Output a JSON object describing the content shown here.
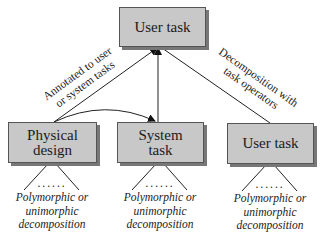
{
  "diagram": {
    "nodes": {
      "top_user_task": {
        "label": "User task"
      },
      "physical_design": {
        "label_line1": "Physical",
        "label_line2": "design"
      },
      "system_task": {
        "label_line1": "System",
        "label_line2": "task"
      },
      "right_user_task": {
        "label": "User task"
      }
    },
    "edges": {
      "annotated": {
        "line1": "Annotated to user",
        "line2": "or system tasks"
      },
      "decomposition": {
        "line1": "Decomposition with",
        "line2": "task operators"
      }
    },
    "captions": {
      "physical_design": {
        "line1": "Polymorphic or",
        "line2": "unimorphic",
        "line3": "decomposition"
      },
      "system_task": {
        "line1": "Polymorphic or",
        "line2": "unimorphic",
        "line3": "decomposition"
      },
      "right_user_task": {
        "line1": "Polymorphic or",
        "line2": "unimorphic",
        "line3": "decomposition"
      }
    },
    "ellipsis": "......",
    "colors": {
      "box_fill": "#c8c8c8",
      "box_border": "#555555",
      "line": "#222222"
    }
  }
}
